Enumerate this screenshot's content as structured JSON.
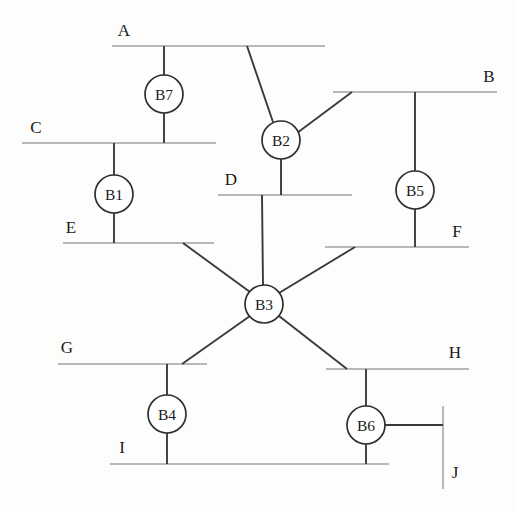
{
  "diagram": {
    "type": "node-bus-network",
    "canvas": {
      "width": 517,
      "height": 512
    },
    "colors": {
      "background": "#fdfdfc",
      "bus_line": "#b9b9b7",
      "branch_line": "#3a3a3a",
      "node_stroke": "#2e2e2e",
      "node_fill": "#ffffff",
      "text": "#1a1a1a"
    },
    "nodes": [
      {
        "id": "B7",
        "label": "B7",
        "cx": 164,
        "cy": 94,
        "r": 19
      },
      {
        "id": "B1",
        "label": "B1",
        "cx": 114,
        "cy": 194,
        "r": 19
      },
      {
        "id": "B2",
        "label": "B2",
        "cx": 281,
        "cy": 140,
        "r": 19
      },
      {
        "id": "B5",
        "label": "B5",
        "cx": 415,
        "cy": 190,
        "r": 19
      },
      {
        "id": "B3",
        "label": "B3",
        "cx": 264,
        "cy": 304,
        "r": 19
      },
      {
        "id": "B4",
        "label": "B4",
        "cx": 167,
        "cy": 414,
        "r": 19
      },
      {
        "id": "B6",
        "label": "B6",
        "cx": 366,
        "cy": 425,
        "r": 19
      }
    ],
    "buses": [
      {
        "id": "A",
        "label": "A",
        "orientation": "horizontal",
        "x1": 112,
        "x2": 325,
        "y": 46,
        "label_x": 124,
        "label_y": 36
      },
      {
        "id": "B",
        "label": "B",
        "orientation": "horizontal",
        "x1": 333,
        "x2": 497,
        "y": 92,
        "label_x": 489,
        "label_y": 82
      },
      {
        "id": "C",
        "label": "C",
        "orientation": "horizontal",
        "x1": 22,
        "x2": 216,
        "y": 143,
        "label_x": 36,
        "label_y": 133
      },
      {
        "id": "D",
        "label": "D",
        "orientation": "horizontal",
        "x1": 218,
        "x2": 352,
        "y": 195,
        "label_x": 231,
        "label_y": 185
      },
      {
        "id": "E",
        "label": "E",
        "orientation": "horizontal",
        "x1": 63,
        "x2": 214,
        "y": 243,
        "label_x": 71,
        "label_y": 233
      },
      {
        "id": "F",
        "label": "F",
        "orientation": "horizontal",
        "x1": 325,
        "x2": 469,
        "y": 247,
        "label_x": 457,
        "label_y": 237
      },
      {
        "id": "G",
        "label": "G",
        "orientation": "horizontal",
        "x1": 58,
        "x2": 207,
        "y": 364,
        "label_x": 67,
        "label_y": 353
      },
      {
        "id": "H",
        "label": "H",
        "orientation": "horizontal",
        "x1": 326,
        "x2": 469,
        "y": 369,
        "label_x": 455,
        "label_y": 358
      },
      {
        "id": "I",
        "label": "I",
        "orientation": "horizontal",
        "x1": 110,
        "x2": 389,
        "y": 464,
        "label_x": 122,
        "label_y": 453
      },
      {
        "id": "J",
        "label": "J",
        "orientation": "vertical",
        "y1": 406,
        "y2": 489,
        "x": 443,
        "label_x": 455,
        "label_y": 478
      }
    ],
    "branches": [
      {
        "id": "A-B7",
        "from": "A",
        "to": "B7",
        "kind": "stub",
        "points": "164,46 164,75"
      },
      {
        "id": "B7-C",
        "from": "B7",
        "to": "C",
        "kind": "stub",
        "points": "164,113 164,143"
      },
      {
        "id": "C-B1",
        "from": "C",
        "to": "B1",
        "kind": "stub",
        "points": "114,143 114,175"
      },
      {
        "id": "B1-E",
        "from": "B1",
        "to": "E",
        "kind": "stub",
        "points": "114,213 114,243"
      },
      {
        "id": "A-B2",
        "from": "A",
        "to": "B2",
        "kind": "diagonal",
        "points": "247,46 273,122"
      },
      {
        "id": "B-B2",
        "from": "B",
        "to": "B2",
        "kind": "diagonal",
        "points": "352,92 297,133"
      },
      {
        "id": "B2-D",
        "from": "B2",
        "to": "D",
        "kind": "stub",
        "points": "281,159 281,195"
      },
      {
        "id": "B-B5",
        "from": "B",
        "to": "B5",
        "kind": "stub",
        "points": "415,92 415,171"
      },
      {
        "id": "B5-F",
        "from": "B5",
        "to": "F",
        "kind": "stub",
        "points": "415,209 415,247"
      },
      {
        "id": "D-B3",
        "from": "D",
        "to": "B3",
        "kind": "stub",
        "points": "262,195 263,285"
      },
      {
        "id": "E-B3",
        "from": "E",
        "to": "B3",
        "kind": "diagonal",
        "points": "183,243 250,292"
      },
      {
        "id": "F-B3",
        "from": "F",
        "to": "B3",
        "kind": "diagonal",
        "points": "355,247 279,293"
      },
      {
        "id": "B3-G",
        "from": "B3",
        "to": "G",
        "kind": "diagonal",
        "points": "250,316 182,364"
      },
      {
        "id": "B3-H",
        "from": "B3",
        "to": "H",
        "kind": "diagonal",
        "points": "279,316 347,369"
      },
      {
        "id": "G-B4",
        "from": "G",
        "to": "B4",
        "kind": "stub",
        "points": "167,364 167,395"
      },
      {
        "id": "B4-I",
        "from": "B4",
        "to": "I",
        "kind": "stub",
        "points": "167,433 167,464"
      },
      {
        "id": "H-B6",
        "from": "H",
        "to": "B6",
        "kind": "stub",
        "points": "366,369 366,406"
      },
      {
        "id": "B6-I",
        "from": "B6",
        "to": "I",
        "kind": "stub",
        "points": "366,444 366,464"
      },
      {
        "id": "B6-J",
        "from": "B6",
        "to": "J",
        "kind": "stub",
        "points": "385,425 443,425"
      }
    ]
  }
}
